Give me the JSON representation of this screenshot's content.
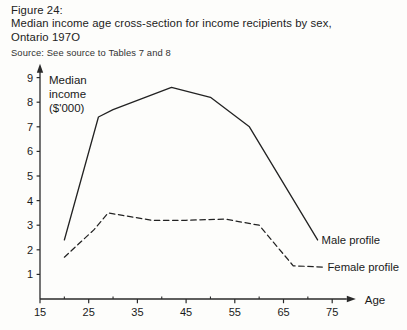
{
  "figure": {
    "number_label": "Figure 24:",
    "title_line1": "Median income age cross-section for income recipients by sex,",
    "title_line2": "Ontario 197O",
    "source": "Source: See source to Tables 7 and 8"
  },
  "chart_data": {
    "type": "line",
    "title": "Median income age cross-section for income recipients by sex, Ontario 197O",
    "xlabel": "Age",
    "ylabel": "Median income ($'000)",
    "ylabel_line1": "Median",
    "ylabel_line2": "income",
    "ylabel_line3": "($'000)",
    "xlim": [
      15,
      78
    ],
    "ylim": [
      0,
      9.4
    ],
    "grid": false,
    "legend_position": "right-inline",
    "x_ticks": [
      15,
      25,
      35,
      45,
      55,
      65,
      75
    ],
    "x_tick_labels": [
      "15",
      "25",
      "35",
      "45",
      "55",
      "65",
      "75"
    ],
    "x_minor_ticks": [
      20,
      30,
      40,
      50,
      60,
      70
    ],
    "y_ticks": [
      1,
      2,
      3,
      4,
      5,
      6,
      7,
      8,
      9
    ],
    "y_tick_labels": [
      "1",
      "2",
      "3",
      "4",
      "5",
      "6",
      "7",
      "8",
      "9"
    ],
    "series": [
      {
        "name": "Male profile",
        "style": "solid",
        "color": "#222222",
        "x": [
          20,
          27,
          30,
          42,
          50,
          58,
          72
        ],
        "values": [
          2.4,
          7.4,
          7.7,
          8.6,
          8.2,
          7.0,
          2.4
        ]
      },
      {
        "name": "Female profile",
        "style": "dashed",
        "color": "#222222",
        "x": [
          20,
          26,
          29,
          38,
          45,
          53,
          60,
          67,
          73
        ],
        "values": [
          1.7,
          2.8,
          3.5,
          3.2,
          3.2,
          3.25,
          3.0,
          1.35,
          1.3
        ]
      }
    ],
    "legend": [
      {
        "label": "Male profile",
        "style": "solid"
      },
      {
        "label": "Female profile",
        "style": "dashed"
      }
    ]
  }
}
